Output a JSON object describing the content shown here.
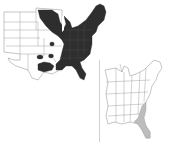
{
  "figure": {
    "left_map": {
      "description": "Range map of eastern United States with range shaded dark",
      "range_color": "#2e2e2e",
      "outline_color": "#8a8a8a"
    },
    "right_map": {
      "description": "Eastern United States state outlines with southeastern coastal plain shaded",
      "range_color": "#bdbdbd",
      "outline_color": "#8a8a8a"
    },
    "divider_color": "#d0d0d0"
  }
}
